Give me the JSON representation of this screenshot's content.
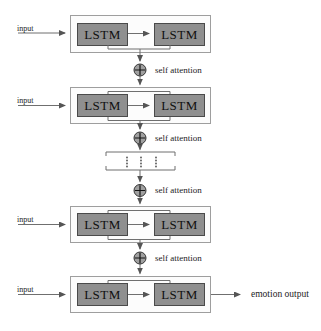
{
  "diagram": {
    "rows": [
      {
        "input_label": "input",
        "cells": [
          "LSTM",
          "LSTM"
        ]
      },
      {
        "input_label": "input",
        "cells": [
          "LSTM",
          "LSTM"
        ]
      },
      {
        "input_label": "input",
        "cells": [
          "LSTM",
          "LSTM"
        ]
      },
      {
        "input_label": "input",
        "cells": [
          "LSTM",
          "LSTM"
        ]
      }
    ],
    "attention_labels": [
      "self attention",
      "self attention",
      "self attention",
      "self attention"
    ],
    "attention_node_icon": "plus-circle-icon",
    "ellipsis_icon": "vertical-ellipsis-icon",
    "output_label": "emotion output",
    "colors": {
      "background": "#ffffff",
      "lstm_fill": "#8f8f8f",
      "lstm_border": "#4a4a4a",
      "layer_box_fill": "#fcfcfc",
      "layer_box_border": "#9e9e9e",
      "connector": "#6f6f6f",
      "node_fill": "#a0a0a0",
      "node_border": "#333333",
      "text": "#1c1c1c"
    }
  }
}
